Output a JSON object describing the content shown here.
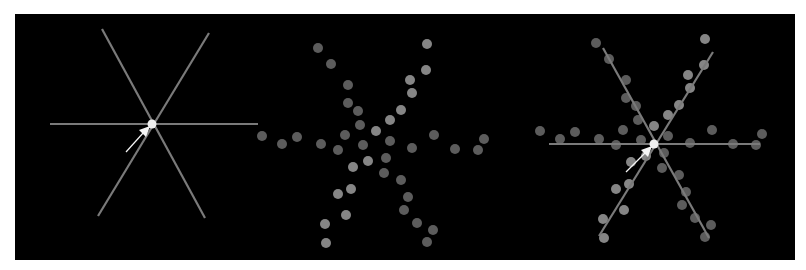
{
  "figure": {
    "background": "#000000",
    "panels": [
      {
        "id": "lines",
        "description": "three intersecting lines with cursor at intersection"
      },
      {
        "id": "points",
        "description": "scattered points forming star pattern"
      },
      {
        "id": "overlay",
        "description": "points with fitted lines overlaid and cursor"
      }
    ]
  },
  "colors": {
    "line": "#7a7a7a",
    "dot_bright": "#858585",
    "dot_dim": "#5c5c5c",
    "center_dot": "#f0f0f0",
    "cursor": "#f5f5f5"
  },
  "left_panel": {
    "center": [
      152,
      124
    ],
    "lines": [
      [
        50,
        124,
        258,
        124
      ],
      [
        102,
        29,
        205,
        218
      ],
      [
        209,
        33,
        98,
        216
      ]
    ],
    "cursor": {
      "tip": [
        150,
        126
      ],
      "tail": [
        126,
        152
      ]
    }
  },
  "points": [
    [
      318,
      48,
      0
    ],
    [
      331,
      64,
      0
    ],
    [
      348,
      85,
      0
    ],
    [
      348,
      103,
      0
    ],
    [
      358,
      111,
      0
    ],
    [
      360,
      125,
      0
    ],
    [
      376,
      131,
      1
    ],
    [
      262,
      136,
      0
    ],
    [
      282,
      144,
      0
    ],
    [
      297,
      137,
      0
    ],
    [
      321,
      144,
      0
    ],
    [
      345,
      135,
      0
    ],
    [
      338,
      150,
      0
    ],
    [
      363,
      145,
      0
    ],
    [
      368,
      161,
      1
    ],
    [
      353,
      167,
      1
    ],
    [
      351,
      189,
      1
    ],
    [
      338,
      194,
      1
    ],
    [
      346,
      215,
      1
    ],
    [
      325,
      224,
      1
    ],
    [
      326,
      243,
      1
    ],
    [
      427,
      44,
      1
    ],
    [
      426,
      70,
      1
    ],
    [
      410,
      80,
      1
    ],
    [
      412,
      93,
      1
    ],
    [
      401,
      110,
      1
    ],
    [
      390,
      120,
      1
    ],
    [
      434,
      135,
      0
    ],
    [
      484,
      139,
      0
    ],
    [
      478,
      150,
      0
    ],
    [
      455,
      149,
      0
    ],
    [
      390,
      141,
      0
    ],
    [
      412,
      148,
      0
    ],
    [
      386,
      158,
      0
    ],
    [
      384,
      173,
      0
    ],
    [
      401,
      180,
      0
    ],
    [
      408,
      197,
      0
    ],
    [
      404,
      210,
      0
    ],
    [
      417,
      223,
      0
    ],
    [
      433,
      230,
      0
    ],
    [
      427,
      242,
      0
    ]
  ],
  "right_panel": {
    "offset": [
      278,
      -5
    ],
    "center": [
      654,
      144
    ],
    "lines": [
      [
        549,
        144,
        760,
        144
      ],
      [
        603,
        48,
        709,
        238
      ],
      [
        713,
        52,
        599,
        236
      ]
    ],
    "cursor": {
      "tip": [
        652,
        146
      ],
      "tail": [
        626,
        172
      ]
    }
  }
}
